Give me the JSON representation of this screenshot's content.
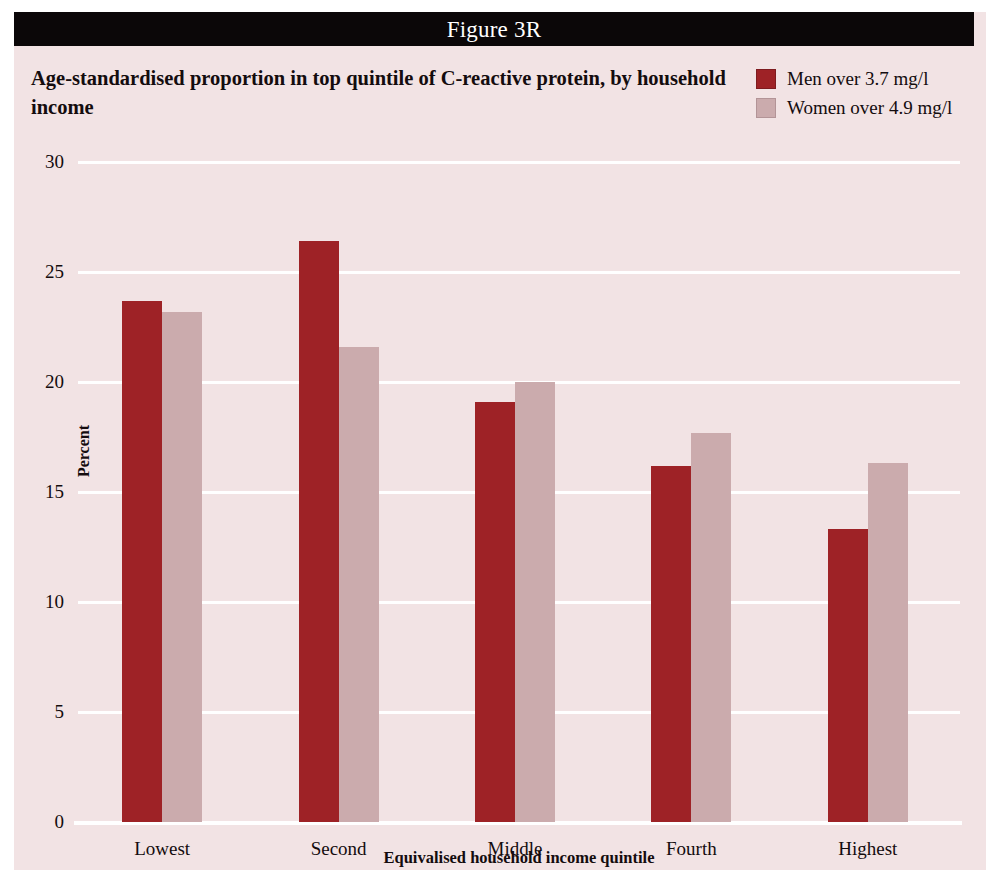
{
  "figure": {
    "label": "Figure 3R",
    "background_color": "#F2E3E4",
    "header_color": "#0B0708"
  },
  "title": "Age-standardised proportion in top quintile of C-reactive protein, by household income",
  "legend": {
    "items": [
      {
        "label": "Men over 3.7 mg/l",
        "color": "#9E2226"
      },
      {
        "label": "Women over 4.9 mg/l",
        "color": "#CBABAD"
      }
    ]
  },
  "chart_data": {
    "type": "bar",
    "title": "Age-standardised proportion in top quintile of C-reactive protein, by household income",
    "subtitle": "Figure 3R",
    "xlabel": "Equivalised household income quintile",
    "ylabel": "Percent",
    "categories": [
      "Lowest",
      "Second",
      "Middle",
      "Fourth",
      "Highest"
    ],
    "series": [
      {
        "name": "Men over 3.7 mg/l",
        "color": "#9E2226",
        "values": [
          23.7,
          26.4,
          19.1,
          16.2,
          13.3
        ]
      },
      {
        "name": "Women over 4.9 mg/l",
        "color": "#CBABAD",
        "values": [
          23.2,
          21.6,
          20.0,
          17.7,
          16.3
        ]
      }
    ],
    "ylim": [
      0,
      30
    ],
    "yticks": [
      0,
      5,
      10,
      15,
      20,
      25,
      30
    ],
    "ytick_labels": [
      "0",
      "5",
      "10",
      "15",
      "20",
      "25",
      "30"
    ],
    "grid": true,
    "grid_color": "#FFFFFF",
    "legend_position": "top-right"
  }
}
